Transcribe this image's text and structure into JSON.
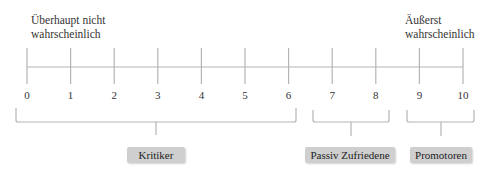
{
  "scale": {
    "left_label": "Überhaupt nicht wahrscheinlich",
    "left_label_lines": [
      "Überhaupt nicht",
      "wahrscheinlich"
    ],
    "right_label": "Äußerst wahrscheinlich",
    "right_label_lines": [
      "Äußerst",
      "wahrscheinlich"
    ],
    "ticks": [
      "0",
      "1",
      "2",
      "3",
      "4",
      "5",
      "6",
      "7",
      "8",
      "9",
      "10"
    ]
  },
  "groups": [
    {
      "label": "Kritiker",
      "range": [
        0,
        6
      ]
    },
    {
      "label": "Passiv Zufriedene",
      "range": [
        7,
        8
      ]
    },
    {
      "label": "Promotoren",
      "range": [
        9,
        10
      ]
    }
  ],
  "colors": {
    "line": "#b5b5b5",
    "box": "#cfcfcf",
    "text": "#333333"
  }
}
